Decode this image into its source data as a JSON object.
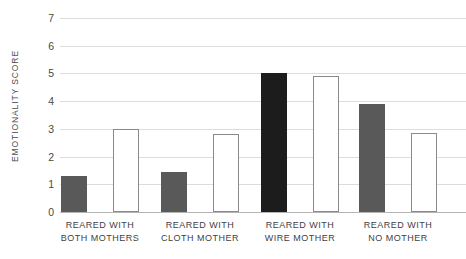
{
  "chart_data": {
    "type": "bar",
    "title": "",
    "xlabel": "",
    "ylabel": "EMOTIONALITY SCORE",
    "ylim": [
      0,
      7
    ],
    "ytick_labels": [
      "0",
      "1",
      "2",
      "3",
      "4",
      "5",
      "6",
      "7"
    ],
    "grid": true,
    "legend": "none",
    "categories": [
      "REARED WITH BOTH MOTHERS",
      "REARED WITH CLOTH MOTHER",
      "REARED WITH WIRE MOTHER",
      "REARED WITH NO MOTHER"
    ],
    "category_lines": [
      {
        "line1": "REARED WITH",
        "line2": "BOTH MOTHERS"
      },
      {
        "line1": "REARED WITH",
        "line2": "CLOTH MOTHER"
      },
      {
        "line1": "REARED WITH",
        "line2": "WIRE MOTHER"
      },
      {
        "line1": "REARED WITH",
        "line2": "NO MOTHER"
      }
    ],
    "series": [
      {
        "name": "filled-bar",
        "style": "filled",
        "values": [
          1.3,
          1.45,
          5.0,
          3.9
        ]
      },
      {
        "name": "outlined-bar",
        "style": "outlined",
        "values": [
          3.0,
          2.8,
          4.9,
          2.85
        ]
      }
    ],
    "bar_colors": {
      "filled_default": "#595959",
      "filled_highlight": "#1c1c1c",
      "outlined_fill": "#ffffff",
      "outlined_stroke": "#8a8a8a"
    },
    "highlight_group_index": 2,
    "gridline_color": "#dcdcdc",
    "baseline_color": "#b4b4b4",
    "text_color": "#4a4a4a"
  },
  "geometry": {
    "plot_left": 60,
    "plot_top": 18,
    "plot_width": 406,
    "plot_height": 194,
    "bar_width": 26,
    "group_centers": [
      100,
      200,
      300,
      398
    ],
    "bar_gap": 26
  }
}
